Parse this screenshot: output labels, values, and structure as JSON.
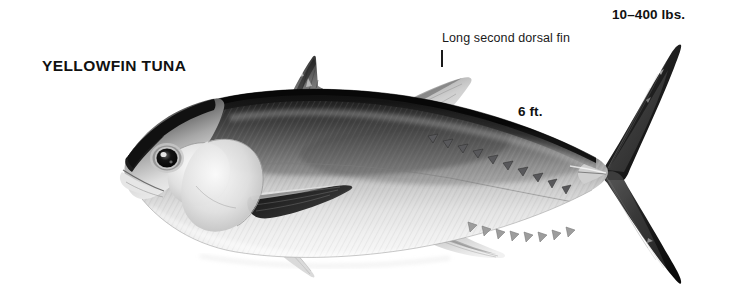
{
  "page": {
    "background_color": "#ffffff",
    "width": 730,
    "height": 307,
    "kind": "scientific-illustration"
  },
  "labels": {
    "species_title": "YELLOWFIN TUNA",
    "weight": "10–400 lbs.",
    "length": "6 ft.",
    "dorsal_annotation": "Long second dorsal fin"
  },
  "illustration": {
    "subject": "yellowfin-tuna",
    "orientation": "left-facing-profile",
    "style": "grayscale airbrush rendering",
    "colors": {
      "background": "#ffffff",
      "dorsal_dark": "#1b1b1b",
      "dorsal_mid": "#4a4a4a",
      "flank_mid": "#8e8e8e",
      "belly_light": "#e8e8e8",
      "belly_white": "#f7f7f7",
      "fin_dark": "#242424",
      "fin_mid": "#6b6b6b",
      "fin_light": "#cfcfcf",
      "outline": "#3a3a3a",
      "text": "#111111"
    },
    "parts": [
      {
        "name": "head",
        "note": "pointed snout at left, large dark eye"
      },
      {
        "name": "eye",
        "note": "dark pupil with pale iris ring"
      },
      {
        "name": "operculum",
        "note": "pale rounded gill cover"
      },
      {
        "name": "first-dorsal-fin",
        "note": "spiny triangular fin, peak near x=313"
      },
      {
        "name": "second-dorsal-fin",
        "note": "long pale sickle-shaped fin"
      },
      {
        "name": "dorsal-finlets",
        "note": "row of small triangular finlets"
      },
      {
        "name": "pectoral-fin",
        "note": "long dark tapering fin"
      },
      {
        "name": "pelvic-fin",
        "note": "small pale ventral fin"
      },
      {
        "name": "anal-fin",
        "note": "pale sickle-shaped fin"
      },
      {
        "name": "anal-finlets",
        "note": "row of small ventral finlets"
      },
      {
        "name": "caudal-peduncle",
        "note": "narrow with lateral keel"
      },
      {
        "name": "caudal-fin",
        "note": "deeply forked lunate dark tail"
      }
    ]
  }
}
